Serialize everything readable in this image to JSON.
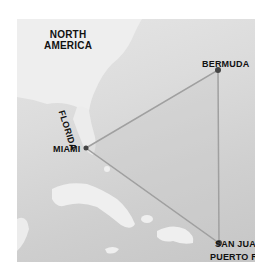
{
  "labels": {
    "region": "NORTH\nAMERICA",
    "region_line1": "NORTH",
    "region_line2": "AMERICA",
    "state": "FLORIDA",
    "miami": "MIAMI",
    "bermuda": "BERMUDA",
    "san_juan": "SAN JUAN",
    "puerto_rico": "PUERTO RICO"
  },
  "points": {
    "miami": [
      69,
      129
    ],
    "bermuda": [
      201,
      51
    ],
    "san_juan": [
      202,
      224
    ]
  },
  "colors": {
    "background": "#ffffff",
    "sea": "#d6d6d6",
    "land": "#ededed",
    "triangle_line": "#9a9a9a",
    "triangle_fill": "#c8c8c8",
    "text": "#111111"
  }
}
